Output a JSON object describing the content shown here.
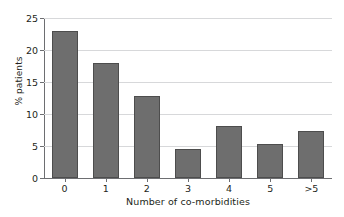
{
  "chart_data": {
    "type": "bar",
    "title": "",
    "xlabel": "Number of co-morbidities",
    "ylabel": "% patients",
    "categories": [
      "0",
      "1",
      "2",
      "3",
      "4",
      "5",
      ">5"
    ],
    "values": [
      23.0,
      18.0,
      12.8,
      4.5,
      8.1,
      5.3,
      7.4
    ],
    "ylim": [
      0,
      25
    ],
    "yticks": [
      0,
      5,
      10,
      15,
      20,
      25
    ],
    "ytick_labels": [
      "0",
      "5",
      "10",
      "15",
      "20",
      "25"
    ],
    "grid": "horizontal",
    "legend": "none",
    "bar_color": "#6e6e6e",
    "bar_edge_color": "#4d4d4d",
    "gridline_color": "#d7d8da",
    "axis_color": "#6d6e71",
    "text_color": "#231f20",
    "background": "#ffffff"
  }
}
